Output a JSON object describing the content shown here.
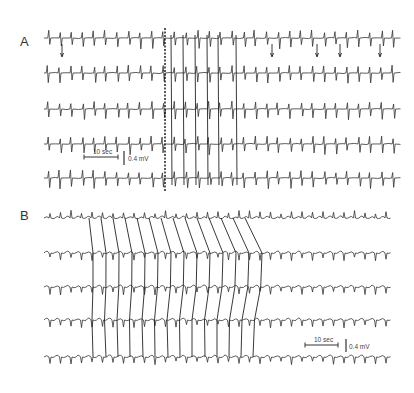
{
  "chart_data": [
    {
      "panel": "A",
      "type": "line",
      "title": "",
      "label": "A",
      "traces": 5,
      "trace_y": [
        38,
        73,
        109,
        144,
        178
      ],
      "x_range": [
        44,
        390
      ],
      "beat_interval_px": 11.5,
      "annotation": {
        "type": "dotted-vertical-line",
        "x": 165
      },
      "vertical_links_x": [
        171,
        183,
        195,
        207,
        218,
        236
      ],
      "arrows_down_x": [
        62,
        272,
        317,
        340,
        380
      ],
      "scale_bar": {
        "time_label": "10 sec",
        "amplitude_label": "0.4 mV",
        "x": 84,
        "y": 157
      },
      "grid": false
    },
    {
      "panel": "B",
      "type": "line",
      "title": "",
      "label": "B",
      "traces": 5,
      "trace_y": [
        218,
        253,
        287,
        320,
        357
      ],
      "x_range": [
        44,
        390
      ],
      "sloped_links": [
        {
          "top_x": 89,
          "bottom_x": 93
        },
        {
          "top_x": 101,
          "bottom_x": 106
        },
        {
          "top_x": 113,
          "bottom_x": 118
        },
        {
          "top_x": 125,
          "bottom_x": 130
        },
        {
          "top_x": 137,
          "bottom_x": 143
        },
        {
          "top_x": 149,
          "bottom_x": 155
        },
        {
          "top_x": 161,
          "bottom_x": 168
        },
        {
          "top_x": 173,
          "bottom_x": 180
        },
        {
          "top_x": 185,
          "bottom_x": 192
        },
        {
          "top_x": 197,
          "bottom_x": 205
        },
        {
          "top_x": 209,
          "bottom_x": 217
        },
        {
          "top_x": 221,
          "bottom_x": 229
        },
        {
          "top_x": 233,
          "bottom_x": 241
        },
        {
          "top_x": 245,
          "bottom_x": 253
        }
      ],
      "scale_bar": {
        "time_label": "10 sec",
        "amplitude_label": "0.4 mV",
        "x": 305,
        "y": 345
      },
      "grid": false
    }
  ],
  "panels": {
    "a": {
      "label": "A"
    },
    "b": {
      "label": "B"
    }
  },
  "scale_a": {
    "time": "10 sec",
    "amp": "0.4 mV"
  },
  "scale_b": {
    "time": "10 sec",
    "amp": "0.4 mV"
  }
}
